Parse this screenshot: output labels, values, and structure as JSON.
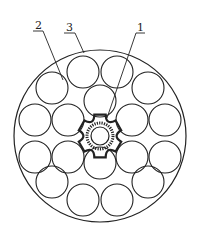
{
  "figure": {
    "type": "cable cross-section",
    "labels": [
      {
        "id": "1",
        "text": "1",
        "x": 140,
        "y": 30,
        "target": "central optical unit"
      },
      {
        "id": "2",
        "text": "2",
        "x": 37,
        "y": 28,
        "target": "strand wire"
      },
      {
        "id": "3",
        "text": "3",
        "x": 69,
        "y": 30,
        "target": "outer sheath"
      }
    ],
    "outer_circle": {
      "cx": 100,
      "cy": 136,
      "r": 86
    },
    "strand_radius": 16,
    "strands": [
      {
        "cx": 83,
        "cy": 72
      },
      {
        "cx": 117,
        "cy": 72
      },
      {
        "cx": 52,
        "cy": 88
      },
      {
        "cx": 148,
        "cy": 88
      },
      {
        "cx": 100,
        "cy": 101
      },
      {
        "cx": 35,
        "cy": 120
      },
      {
        "cx": 68,
        "cy": 120
      },
      {
        "cx": 132,
        "cy": 120
      },
      {
        "cx": 165,
        "cy": 120
      },
      {
        "cx": 35,
        "cy": 157
      },
      {
        "cx": 68,
        "cy": 157
      },
      {
        "cx": 132,
        "cy": 157
      },
      {
        "cx": 165,
        "cy": 157
      },
      {
        "cx": 100,
        "cy": 163
      },
      {
        "cx": 52,
        "cy": 182
      },
      {
        "cx": 148,
        "cy": 182
      },
      {
        "cx": 83,
        "cy": 200
      },
      {
        "cx": 117,
        "cy": 200
      }
    ],
    "center": {
      "cx": 100,
      "cy": 136,
      "tube_r": 13,
      "inner_r": 9
    }
  }
}
